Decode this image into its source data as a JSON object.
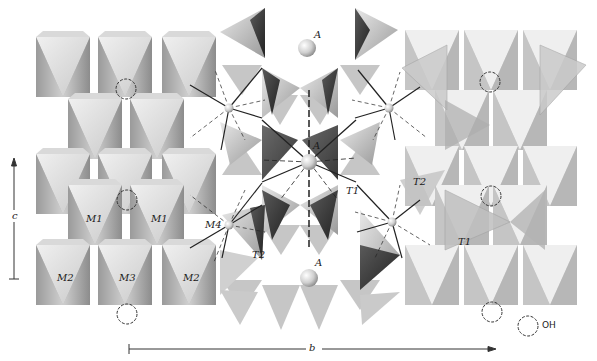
{
  "figure": {
    "type": "crystal-structure-polyhedral-diagram",
    "colors": {
      "background": "#ffffff",
      "octahedron_light": "#e6e6e6",
      "octahedron_mid": "#c4c4c4",
      "octahedron_dark": "#8f8f8f",
      "tetrahedron_dark": "#3a3a3a",
      "tetrahedron_light": "#cfcfcf",
      "bond_line": "#222222",
      "sphere": "#d8d8d8",
      "oh_circle": "#333333"
    }
  },
  "labels": {
    "a_top": "A",
    "a_center": "A",
    "a_bottom": "A",
    "m1_left": "M1",
    "m1_right": "M1",
    "m2_left": "M2",
    "m3": "M3",
    "m2_right": "M2",
    "m4": "M4",
    "t1_center": "T1",
    "t2_center": "T2",
    "t2_right": "T2",
    "t1_right": "T1"
  },
  "axes": {
    "c": {
      "label": "c",
      "direction": "up"
    },
    "b": {
      "label": "b",
      "direction": "right"
    }
  },
  "legend": {
    "oh_label": "OH"
  }
}
